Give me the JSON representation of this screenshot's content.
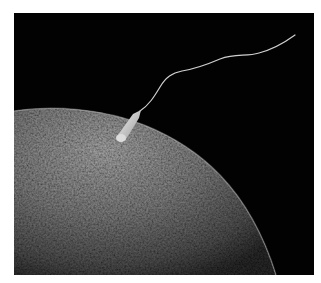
{
  "image": {
    "subject": "Scanning electron micrograph: sperm cell attaching to the surface of an egg cell",
    "alt": "Sperm cell with long flagellum attached to textured surface of a large egg against black background",
    "colors": {
      "background": "#020202",
      "egg_light": "#b5b5b5",
      "egg_dark": "#3a3a3a",
      "sperm": "#d8d8d8",
      "border": "#ffffff"
    }
  }
}
